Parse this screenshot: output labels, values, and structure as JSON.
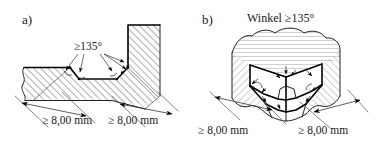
{
  "figure": {
    "background_color": "#ffffff",
    "line_color": "#000000",
    "hatch_color": "#8a8a8a"
  },
  "panel_a": {
    "label": "a)",
    "view_type": "cross-section",
    "angle_label": "≥135°",
    "dimension_left": "≥ 8,00 mm",
    "dimension_right": "≥ 8,00 mm"
  },
  "panel_b": {
    "label": "b)",
    "view_type": "isometric",
    "title": "Winkel ≥135°",
    "dimension_left": "≥ 8,00 mm",
    "dimension_right": "≥ 8,00 mm"
  },
  "annotations": {
    "angle_symbol": "≥135°",
    "min_dimension": "≥ 8,00 mm",
    "unit": "mm",
    "minimum_angle_deg": 135,
    "minimum_length_mm": 8.0
  }
}
